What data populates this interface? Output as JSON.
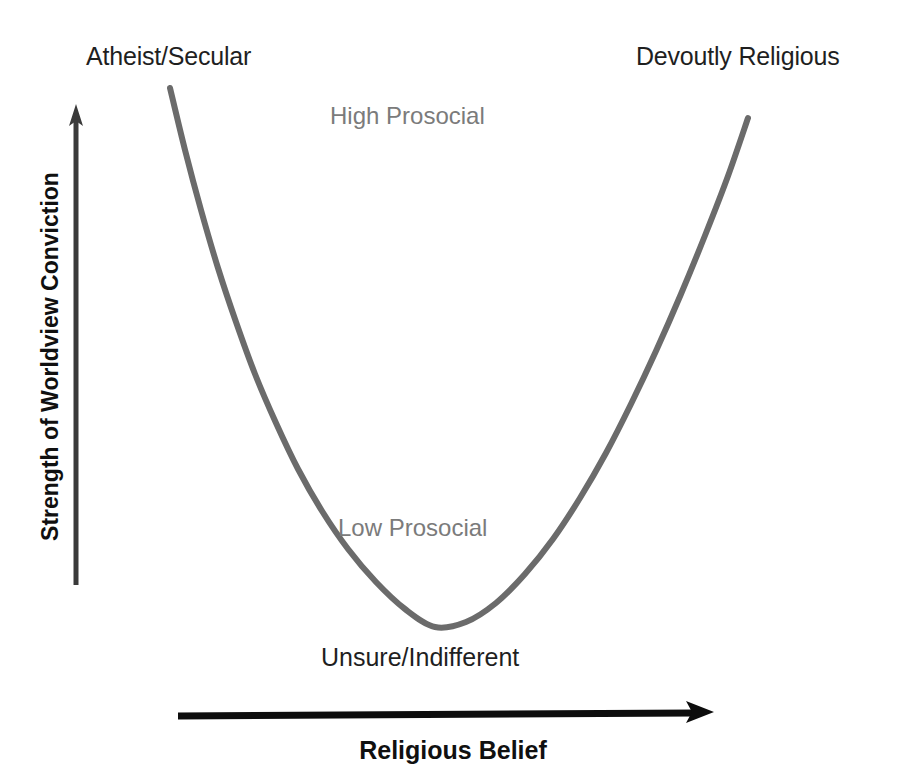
{
  "figure": {
    "width": 906,
    "height": 779,
    "background": "#ffffff"
  },
  "axes": {
    "x": {
      "title": "Religious Belief",
      "arrow": {
        "from_x": 178,
        "to_x": 714,
        "y": 714,
        "color": "#0d0d0d",
        "direction": "right"
      },
      "tick_labels": [
        "Atheist/Secular",
        "Unsure/Indifferent",
        "Devoutly Religious"
      ]
    },
    "y": {
      "title": "Strength of Worldview Conviction",
      "arrow": {
        "x": 76,
        "from_y": 585,
        "to_y": 106,
        "color": "#3a3a3a",
        "direction": "up"
      }
    }
  },
  "labels": {
    "left_pole": "Atheist/Secular",
    "right_pole": "Devoutly Religious",
    "center_bottom": "Unsure/Indifferent"
  },
  "annotations": [
    {
      "text": "High Prosocial",
      "color": "#7b7b7b",
      "x": 330,
      "y": 104
    },
    {
      "text": "Low Prosocial",
      "color": "#7b7b7b",
      "x": 338,
      "y": 516
    }
  ],
  "colors": {
    "curve": "#6b6b6b",
    "text": "#1f1f1f",
    "annotation": "#7b7b7b",
    "axis_arrow_x": "#0d0d0d",
    "axis_arrow_y": "#3a3a3a",
    "background": "#ffffff"
  },
  "chart_data": {
    "type": "line",
    "title": "",
    "subtitle": "",
    "xlabel": "Religious Belief",
    "ylabel": "Strength of Worldview Conviction",
    "xlim": [
      0,
      1
    ],
    "ylim": [
      0,
      1
    ],
    "grid": false,
    "legend": "none",
    "curve_shape": "U-shaped (quadratic / parabola), minimum near the center",
    "stroke_width": 6,
    "stroke_color": "#6b6b6b",
    "x_tick_labels": [
      "Atheist/Secular",
      "Unsure/Indifferent",
      "Devoutly Religious"
    ],
    "annotations": [
      "High Prosocial",
      "Low Prosocial"
    ],
    "series": [
      {
        "name": "Strength of Worldview Conviction vs Religious Belief",
        "points_px": [
          [
            170,
            88
          ],
          [
            185,
            150
          ],
          [
            201,
            210
          ],
          [
            218,
            268
          ],
          [
            236,
            322
          ],
          [
            255,
            374
          ],
          [
            276,
            423
          ],
          [
            298,
            469
          ],
          [
            322,
            511
          ],
          [
            348,
            549
          ],
          [
            376,
            582
          ],
          [
            405,
            609
          ],
          [
            435,
            627
          ],
          [
            466,
            622
          ],
          [
            496,
            603
          ],
          [
            525,
            574
          ],
          [
            553,
            539
          ],
          [
            580,
            498
          ],
          [
            606,
            453
          ],
          [
            631,
            404
          ],
          [
            656,
            351
          ],
          [
            681,
            294
          ],
          [
            706,
            233
          ],
          [
            728,
            176
          ],
          [
            748,
            118
          ]
        ],
        "points_normalized": [
          [
            0.0,
            1.0
          ],
          [
            0.05,
            0.88
          ],
          [
            0.1,
            0.77
          ],
          [
            0.15,
            0.66
          ],
          [
            0.2,
            0.56
          ],
          [
            0.25,
            0.47
          ],
          [
            0.3,
            0.38
          ],
          [
            0.35,
            0.29
          ],
          [
            0.4,
            0.22
          ],
          [
            0.45,
            0.15
          ],
          [
            0.48,
            0.09
          ],
          [
            0.5,
            0.03
          ],
          [
            0.52,
            0.0
          ],
          [
            0.55,
            0.01
          ],
          [
            0.58,
            0.05
          ],
          [
            0.62,
            0.1
          ],
          [
            0.66,
            0.17
          ],
          [
            0.7,
            0.25
          ],
          [
            0.74,
            0.33
          ],
          [
            0.78,
            0.42
          ],
          [
            0.82,
            0.52
          ],
          [
            0.86,
            0.63
          ],
          [
            0.9,
            0.74
          ],
          [
            0.95,
            0.85
          ],
          [
            1.0,
            0.98
          ]
        ]
      }
    ]
  }
}
